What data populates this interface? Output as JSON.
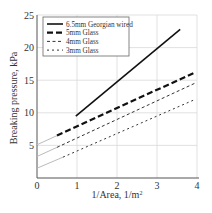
{
  "chart_data": {
    "type": "line",
    "title": "",
    "xlabel": "1/Area, 1/m²",
    "xlabel_base": "1/Area, 1/m",
    "xlabel_sup": "2",
    "ylabel": "Breaking pressure, kPa",
    "xlim": [
      0,
      4
    ],
    "ylim": [
      0,
      25
    ],
    "x_ticks": [
      0,
      1,
      2,
      3,
      4
    ],
    "y_ticks": [
      0,
      5,
      10,
      15,
      20,
      25
    ],
    "grid": true,
    "legend_position": "upper left",
    "series": [
      {
        "name": "6.5mm Georgian wired",
        "style": "solid",
        "color": "#111111",
        "x": [
          0.97,
          3.58
        ],
        "y": [
          9.5,
          22.8
        ]
      },
      {
        "name": "5mm Glass",
        "style": "long-dash",
        "color": "#111111",
        "x": [
          0.5,
          3.95
        ],
        "y": [
          6.5,
          16.2
        ],
        "extrapolation": {
          "x": [
            0.0,
            0.5
          ],
          "y": [
            5.1,
            6.5
          ],
          "color": "#bbbbbb"
        }
      },
      {
        "name": "4mm Glass",
        "style": "medium-dash",
        "color": "#333333",
        "x": [
          0.5,
          3.97
        ],
        "y": [
          4.7,
          14.6
        ],
        "extrapolation": {
          "x": [
            0.0,
            0.5
          ],
          "y": [
            3.3,
            4.7
          ],
          "color": "#bbbbbb"
        }
      },
      {
        "name": "3mm Glass",
        "style": "short-dash",
        "color": "#333333",
        "x": [
          0.65,
          3.97
        ],
        "y": [
          3.2,
          12.1
        ],
        "extrapolation": {
          "x": [
            0.0,
            0.65
          ],
          "y": [
            1.5,
            3.2
          ],
          "color": "#bbbbbb"
        }
      }
    ]
  }
}
